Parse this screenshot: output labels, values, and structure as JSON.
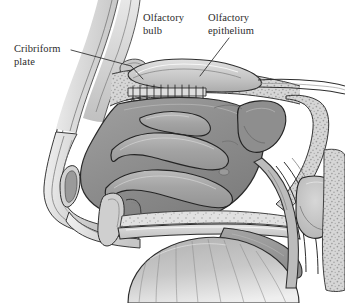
{
  "figure": {
    "background_color": "#ffffff",
    "width": 345,
    "height": 303,
    "style": "grayscale medical illustration"
  },
  "labels": {
    "cribriform_plate": "Cribriform\nplate",
    "olfactory_bulb": "Olfactory\nbulb",
    "olfactory_epithelium": "Olfactory\nepithelium"
  },
  "colors": {
    "ink": "#2b2b2b",
    "outline": "#1a1a1a",
    "bone_light": "#d9d9d9",
    "bone_mid": "#c2c2c2",
    "tissue_mid": "#a8a8a8",
    "tissue_dark": "#8a8a8a",
    "cavity_dark": "#7c7c7c",
    "highlight": "#efefef",
    "stipple": "#9a9a9a"
  },
  "structures": [
    "forehead and frontal bone",
    "frontal sinus",
    "olfactory bulb",
    "cribriform plate",
    "olfactory nerve fibers",
    "olfactory epithelium",
    "superior nasal concha",
    "middle nasal concha",
    "inferior nasal concha",
    "nasal vestibule",
    "nostril",
    "hard palate",
    "soft palate",
    "tongue",
    "sphenoid sinus",
    "nasopharynx",
    "pharyngeal wall",
    "cervical vertebra"
  ]
}
